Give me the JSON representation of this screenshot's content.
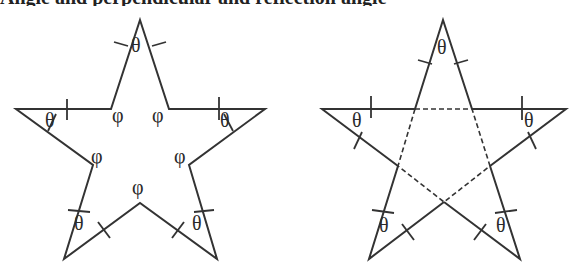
{
  "caption_cropped": "Angle and perpendicular and reflection angle",
  "figures": [
    {
      "name": "star-interior-angles",
      "vertex_angle_label": "θ",
      "interior_angle_label": "φ",
      "labels": {
        "top": "θ",
        "left": "θ",
        "right": "θ",
        "bottom_left": "θ",
        "bottom_right": "θ",
        "inner_top_left": "φ",
        "inner_top_right": "φ",
        "inner_left": "φ",
        "inner_right": "φ",
        "inner_bottom": "φ"
      }
    },
    {
      "name": "pentagram-with-dashed-pentagon",
      "vertex_angle_label": "θ",
      "labels": {
        "top": "θ",
        "left": "θ",
        "right": "θ",
        "bottom_left": "θ",
        "bottom_right": "θ"
      }
    }
  ],
  "colors": {
    "stroke": "#333333",
    "background": "#ffffff"
  }
}
